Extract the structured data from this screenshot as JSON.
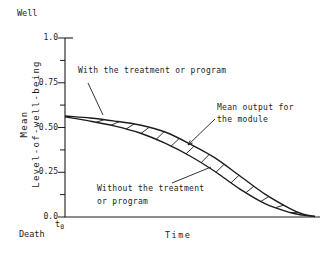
{
  "figure": {
    "well_label": "Well",
    "death_label": "Death",
    "time_label": "Time",
    "origin_base": "t",
    "origin_sub": "0",
    "ylabel_line1": "Mean",
    "ylabel_line2": "Level-of-well-being",
    "annotation_with": "With the treatment or program",
    "annotation_without_line1": "Without the treatment",
    "annotation_without_line2": "or program",
    "annotation_module_line1": "Mean output for",
    "annotation_module_line2": "the module",
    "ink_color": "#1c1c1c",
    "background": "#ffffff"
  },
  "chart_data": {
    "type": "line",
    "xlabel": "Time",
    "ylabel": "Mean Level-of-well-being",
    "x_origin_label": "t0",
    "y_axis_top_label": "Well",
    "y_axis_bottom_label": "Death",
    "ylim": [
      0,
      1
    ],
    "xlim": [
      0,
      1
    ],
    "ytick_values": [
      1.0,
      0.75,
      0.5,
      0.25,
      0.0
    ],
    "ytick_labels": [
      "1.0",
      "0.75",
      "0.50",
      "0.25",
      "0.0"
    ],
    "minor_ytick_values": [
      0.875,
      0.625,
      0.375,
      0.125
    ],
    "grid": false,
    "band_label": "Mean output for the module",
    "band_style": "hatched",
    "x": [
      0,
      0.1,
      0.2,
      0.3,
      0.4,
      0.5,
      0.6,
      0.7,
      0.8,
      0.9,
      0.95,
      1.0
    ],
    "series": [
      {
        "name": "With the treatment or program",
        "values": [
          0.564,
          0.553,
          0.536,
          0.514,
          0.475,
          0.408,
          0.33,
          0.229,
          0.128,
          0.047,
          0.017,
          0.003
        ]
      },
      {
        "name": "Without the treatment or program",
        "values": [
          0.559,
          0.536,
          0.508,
          0.469,
          0.413,
          0.341,
          0.254,
          0.156,
          0.075,
          0.025,
          0.011,
          0.003
        ]
      }
    ]
  }
}
